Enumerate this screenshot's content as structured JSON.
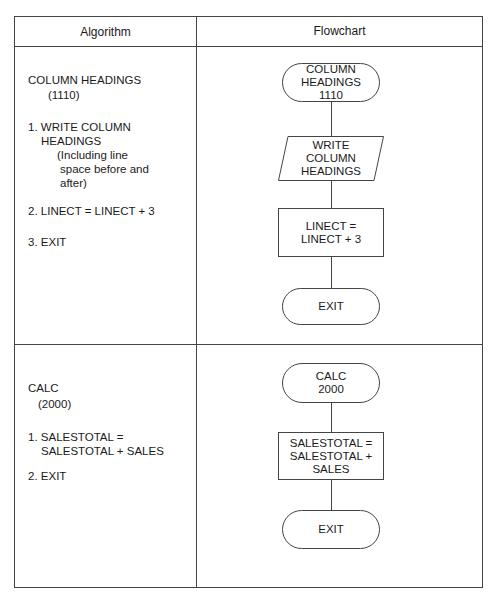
{
  "table": {
    "headers": {
      "algorithm": "Algorithm",
      "flowchart": "Flowchart"
    }
  },
  "rows": [
    {
      "algorithm": {
        "title": "COLUMN HEADINGS",
        "code": "(1110)",
        "steps": [
          "1. WRITE COLUMN",
          "HEADINGS",
          "(Including line",
          "space before and",
          "after)",
          "2. LINECT = LINECT + 3",
          "3. EXIT"
        ]
      },
      "flowchart": {
        "start": "COLUMN\nHEADINGS\n1110",
        "io": "WRITE\nCOLUMN\nHEADINGS",
        "process": "LINECT =\nLINECT + 3",
        "end": "EXIT"
      }
    },
    {
      "algorithm": {
        "title": "CALC",
        "code": "(2000)",
        "steps": [
          "1. SALESTOTAL =",
          "SALESTOTAL + SALES",
          "2. EXIT"
        ]
      },
      "flowchart": {
        "start": "CALC\n2000",
        "process": "SALESTOTAL =\nSALESTOTAL +\nSALES",
        "end": "EXIT"
      }
    }
  ],
  "colors": {
    "line": "#444444",
    "text": "#1a1a1a",
    "background": "#ffffff"
  }
}
